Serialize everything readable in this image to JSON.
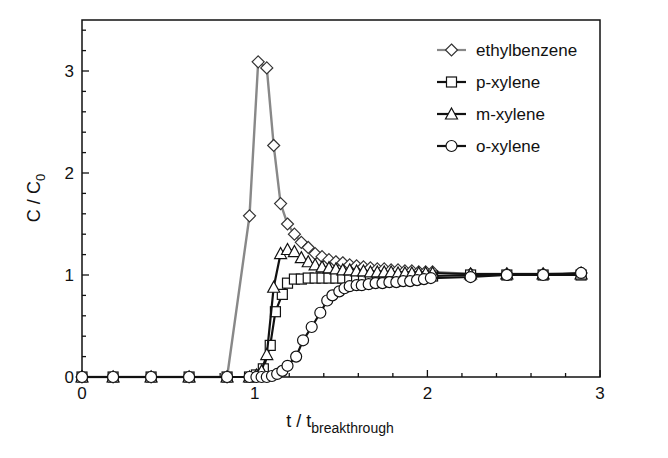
{
  "chart_data": {
    "type": "line",
    "title": "",
    "xlabel": "t / t",
    "xlabel_subscript": "breakthrough",
    "ylabel": "C / C",
    "ylabel_subscript": "0",
    "xlim": [
      0,
      3
    ],
    "ylim": [
      0,
      3.45
    ],
    "xticks": [
      0,
      1,
      2,
      3
    ],
    "xtick_labels": [
      "0",
      "1",
      "2",
      "3"
    ],
    "yticks": [
      0,
      1,
      2,
      3
    ],
    "ytick_labels": [
      "0",
      "1",
      "2",
      "3"
    ],
    "grid": false,
    "legend_position": "upper right",
    "series": [
      {
        "name": "ethylbenzene",
        "marker": "diamond",
        "line_color": "#888888",
        "x": [
          0,
          0.18,
          0.4,
          0.62,
          0.84,
          0.97,
          1.02,
          1.07,
          1.11,
          1.15,
          1.19,
          1.23,
          1.27,
          1.31,
          1.35,
          1.39,
          1.43,
          1.47,
          1.51,
          1.55,
          1.59,
          1.63,
          1.67,
          1.71,
          1.75,
          1.79,
          1.83,
          1.87,
          1.91,
          1.95,
          1.99,
          2.03,
          2.25,
          2.46,
          2.67,
          2.89
        ],
        "y": [
          0,
          0,
          0,
          0,
          0,
          1.58,
          3.09,
          3.03,
          2.27,
          1.7,
          1.5,
          1.4,
          1.32,
          1.27,
          1.21,
          1.18,
          1.15,
          1.13,
          1.12,
          1.1,
          1.09,
          1.08,
          1.07,
          1.06,
          1.06,
          1.05,
          1.05,
          1.04,
          1.04,
          1.03,
          1.03,
          1.03,
          1.01,
          1.01,
          1.01,
          1.02
        ]
      },
      {
        "name": "p-xylene",
        "marker": "square",
        "line_color": "#111111",
        "x": [
          0,
          0.18,
          0.4,
          0.62,
          0.84,
          0.97,
          1.01,
          1.05,
          1.09,
          1.12,
          1.16,
          1.19,
          1.23,
          1.27,
          1.31,
          1.35,
          1.39,
          1.43,
          1.47,
          1.51,
          1.55,
          1.59,
          1.63,
          1.67,
          1.71,
          1.75,
          1.79,
          1.83,
          1.87,
          1.91,
          1.95,
          1.99,
          2.03,
          2.25,
          2.46,
          2.67,
          2.89
        ],
        "y": [
          0,
          0,
          0,
          0,
          0,
          0,
          0.02,
          0.08,
          0.31,
          0.64,
          0.81,
          0.92,
          0.96,
          0.96,
          0.97,
          0.97,
          0.97,
          0.97,
          0.97,
          0.97,
          0.97,
          0.97,
          0.97,
          0.97,
          0.97,
          0.97,
          0.97,
          0.98,
          0.98,
          0.98,
          0.98,
          0.98,
          0.99,
          1.0,
          1.0,
          1.0,
          1.0
        ]
      },
      {
        "name": "m-xylene",
        "marker": "triangle",
        "line_color": "#111111",
        "x": [
          0,
          0.18,
          0.4,
          0.62,
          0.84,
          0.97,
          1.01,
          1.04,
          1.07,
          1.11,
          1.15,
          1.19,
          1.23,
          1.27,
          1.31,
          1.35,
          1.39,
          1.43,
          1.47,
          1.51,
          1.55,
          1.59,
          1.63,
          1.67,
          1.71,
          1.75,
          1.79,
          1.83,
          1.87,
          1.91,
          1.95,
          1.99,
          2.03,
          2.25,
          2.46,
          2.67,
          2.89
        ],
        "y": [
          0,
          0,
          0,
          0,
          0,
          0,
          0.02,
          0.06,
          0.22,
          0.88,
          1.21,
          1.25,
          1.23,
          1.17,
          1.13,
          1.1,
          1.08,
          1.07,
          1.06,
          1.05,
          1.05,
          1.04,
          1.04,
          1.03,
          1.03,
          1.03,
          1.03,
          1.02,
          1.02,
          1.02,
          1.02,
          1.02,
          1.02,
          1.01,
          1.01,
          1.01,
          1.01
        ]
      },
      {
        "name": "o-xylene",
        "marker": "circle",
        "line_color": "#111111",
        "x": [
          0,
          0.18,
          0.4,
          0.62,
          0.84,
          0.97,
          1.01,
          1.04,
          1.07,
          1.1,
          1.13,
          1.16,
          1.19,
          1.24,
          1.28,
          1.33,
          1.38,
          1.42,
          1.45,
          1.49,
          1.52,
          1.55,
          1.59,
          1.62,
          1.66,
          1.7,
          1.74,
          1.78,
          1.82,
          1.86,
          1.9,
          1.94,
          1.98,
          2.02,
          2.25,
          2.46,
          2.67,
          2.89
        ],
        "y": [
          0,
          0,
          0,
          0,
          0,
          0,
          0,
          0,
          0,
          0.01,
          0.03,
          0.06,
          0.11,
          0.2,
          0.36,
          0.49,
          0.63,
          0.75,
          0.8,
          0.84,
          0.87,
          0.89,
          0.9,
          0.9,
          0.91,
          0.92,
          0.92,
          0.93,
          0.93,
          0.94,
          0.94,
          0.95,
          0.96,
          0.97,
          0.98,
          1.0,
          1.0,
          1.02
        ]
      }
    ]
  },
  "legend": {
    "items": [
      {
        "label": "ethylbenzene",
        "marker": "diamond",
        "line_color": "#888888"
      },
      {
        "label": "p-xylene",
        "marker": "square",
        "line_color": "#111111"
      },
      {
        "label": "m-xylene",
        "marker": "triangle",
        "line_color": "#111111"
      },
      {
        "label": "o-xylene",
        "marker": "circle",
        "line_color": "#111111"
      }
    ]
  },
  "axes": {
    "x_label_main": "t / t",
    "x_label_sub": "breakthrough",
    "y_label_main": "C / C",
    "y_label_sub": "0"
  }
}
